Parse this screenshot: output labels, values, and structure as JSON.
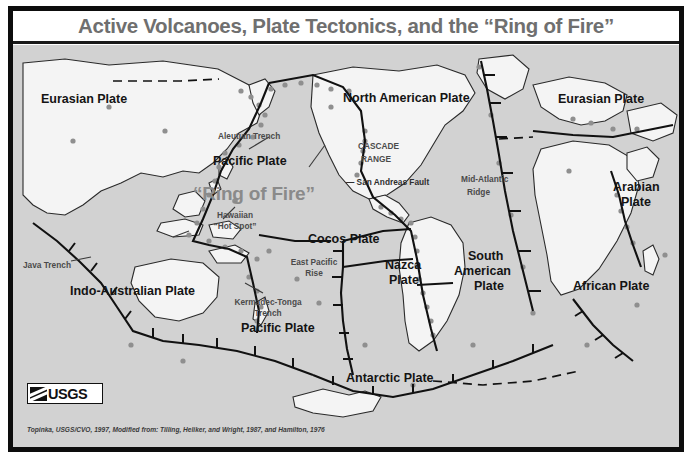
{
  "poster": {
    "title": "Active Volcanoes, Plate Tectonics, and the “Ring of Fire”",
    "credit": "Topinka, USGS/CVO, 1997, Modified from: Tilling, Heliker, and Wright, 1987, and Hamilton, 1976",
    "logo_text": "USGS",
    "colors": {
      "frame": "#0d0d0d",
      "title_text": "#6f6f6f",
      "ocean": "#d2d2d2",
      "land": "#f2f2f2",
      "volcano_marker": "#8c8c8c",
      "plate_boundary": "#111111",
      "ring_of_fire_text": "#8a8a8a"
    }
  },
  "map": {
    "ring_of_fire_label": "“Ring of Fire”",
    "plates": [
      {
        "label": "Eurasian Plate",
        "x": 28,
        "y": 48,
        "size": "lg"
      },
      {
        "label": "North American Plate",
        "x": 330,
        "y": 47,
        "size": "lg"
      },
      {
        "label": "Eurasian Plate",
        "x": 545,
        "y": 48,
        "size": "lg"
      },
      {
        "label": "Pacific Plate",
        "x": 200,
        "y": 110,
        "size": "lg"
      },
      {
        "label": "Arabian",
        "x": 600,
        "y": 136,
        "size": "lg"
      },
      {
        "label": "Plate",
        "x": 605,
        "y": 151,
        "size": "lg"
      },
      {
        "label": "Cocos Plate",
        "x": 295,
        "y": 188,
        "size": "lg"
      },
      {
        "label": "Nazca",
        "x": 372,
        "y": 214,
        "size": "lg"
      },
      {
        "label": "Plate",
        "x": 374,
        "y": 229,
        "size": "lg"
      },
      {
        "label": "South",
        "x": 452,
        "y": 205,
        "size": "lg"
      },
      {
        "label": "American",
        "x": 441,
        "y": 220,
        "size": "lg"
      },
      {
        "label": "Plate",
        "x": 458,
        "y": 235,
        "size": "lg"
      },
      {
        "label": "African Plate",
        "x": 560,
        "y": 235,
        "size": "lg"
      },
      {
        "label": "Indo-Australian Plate",
        "x": 57,
        "y": 240,
        "size": "lg"
      },
      {
        "label": "Pacific Plate",
        "x": 228,
        "y": 277,
        "size": "lg"
      },
      {
        "label": "Antarctic Plate",
        "x": 333,
        "y": 327,
        "size": "lg"
      }
    ],
    "features": [
      {
        "label": "Aleutian Trench",
        "x": 205,
        "y": 87,
        "align": "left"
      },
      {
        "label": "CASCADE",
        "x": 345,
        "y": 97,
        "align": "left"
      },
      {
        "label": "RANGE",
        "x": 348,
        "y": 110,
        "align": "left"
      },
      {
        "label": "— San Andreas Fault",
        "x": 333,
        "y": 133,
        "align": "left"
      },
      {
        "label": "Mid-Atlantic",
        "x": 448,
        "y": 130,
        "align": "left"
      },
      {
        "label": "Ridge",
        "x": 454,
        "y": 143,
        "align": "left"
      },
      {
        "label": "Hawaiian",
        "x": 222,
        "y": 166,
        "align": "center"
      },
      {
        "label": "“Hot Spot”",
        "x": 222,
        "y": 177,
        "align": "center"
      },
      {
        "label": "East Pacific",
        "x": 301,
        "y": 213,
        "align": "center"
      },
      {
        "label": "Rise",
        "x": 301,
        "y": 224,
        "align": "center"
      },
      {
        "label": "Java Trench",
        "x": 10,
        "y": 216,
        "align": "left"
      },
      {
        "label": "Kermadec-Tonga",
        "x": 255,
        "y": 253,
        "align": "center"
      },
      {
        "label": "Trench",
        "x": 255,
        "y": 264,
        "align": "center"
      }
    ]
  }
}
